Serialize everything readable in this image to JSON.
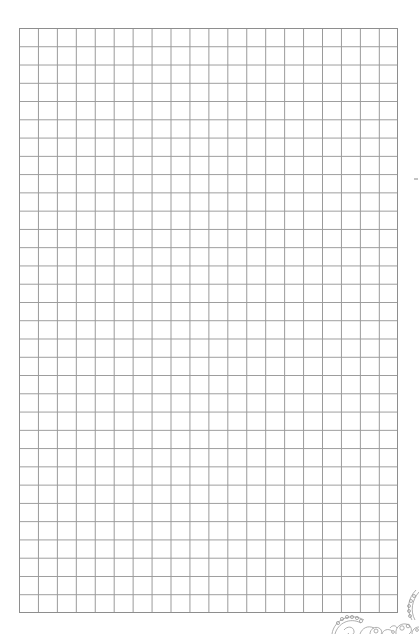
{
  "page": {
    "type": "graph-paper",
    "background_color": "#ffffff",
    "grid": {
      "columns": 20,
      "rows": 32,
      "line_color": "#9a9a9a",
      "border_color": "#8e8e8e",
      "cell_width_px": 18.95,
      "cell_height_px": 18.28
    },
    "decorations": {
      "corner_flourish": "floral-paisley-ornament",
      "corner_position": "bottom-right",
      "edge_mark": "small-gray-tick"
    }
  }
}
